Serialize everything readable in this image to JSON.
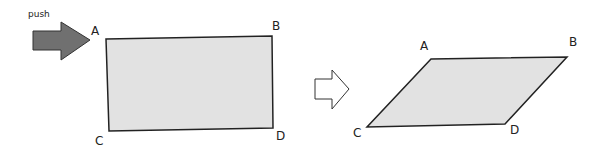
{
  "labels": {
    "push": "push",
    "before": {
      "a": "A",
      "b": "B",
      "c": "C",
      "d": "D"
    },
    "after": {
      "a": "A",
      "b": "B",
      "c": "C",
      "d": "D"
    }
  },
  "colors": {
    "fill": "#e2e2e2",
    "stroke": "#222222",
    "arrow_fill": "#707070"
  }
}
